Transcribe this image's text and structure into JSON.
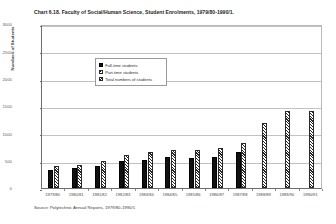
{
  "chart_data": {
    "type": "bar",
    "title": "Chart 6.18.  Faculty of Social/Human Science, Student Enrolments, 1979/80-1990/1.",
    "xlabel": "",
    "ylabel": "Numbers of Students",
    "ylim": [
      0,
      3000
    ],
    "ytick_labels": [
      "3000",
      "2500",
      "2000",
      "1500",
      "1000",
      "500",
      "0"
    ],
    "ytick_values": [
      3000,
      2500,
      2000,
      1500,
      1000,
      500,
      0
    ],
    "grid": true,
    "legend_position": "upper-left-inside",
    "categories": [
      "1979/80",
      "1980/81",
      "1981/82",
      "1982/83",
      "1983/84",
      "1984/85",
      "1985/86",
      "1986/87",
      "1987/88",
      "1988/89",
      "1989/90",
      "1990/91"
    ],
    "series": [
      {
        "name": "Full-time students",
        "swatch": "solid-black",
        "values": [
          330,
          360,
          400,
          500,
          520,
          560,
          540,
          560,
          650,
          null,
          null,
          null
        ]
      },
      {
        "name": "Part-time students",
        "swatch": "hatch-backward",
        "values": [
          null,
          null,
          null,
          null,
          null,
          null,
          null,
          null,
          null,
          null,
          null,
          null
        ]
      },
      {
        "name": "Total numbers of students",
        "swatch": "hatch-forward",
        "values": [
          400,
          430,
          500,
          600,
          660,
          700,
          700,
          740,
          830,
          1190,
          1400,
          1400
        ]
      }
    ]
  },
  "source": {
    "text": "Source: Polytechnic Annual Reports, 1979/80-1990/1"
  },
  "colors": {
    "axis": "#6d6d6d",
    "grid": "#c2c2c2",
    "fulltime": "#111111",
    "hatch": "#262626",
    "text": "#2b2b2b"
  }
}
